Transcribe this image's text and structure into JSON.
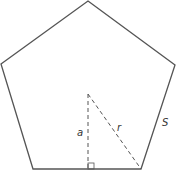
{
  "diagram": {
    "shape": "regular-pentagon",
    "vertices": [
      [
        88,
        1
      ],
      [
        175,
        65
      ],
      [
        141,
        169
      ],
      [
        33,
        169
      ],
      [
        1,
        64
      ]
    ],
    "center": [
      88,
      94
    ],
    "apothem_foot": [
      88,
      169
    ],
    "labels": {
      "apothem": "a",
      "radius": "r",
      "side": "S"
    },
    "colors": {
      "stroke": "#555555",
      "label": "#333333",
      "background": "#ffffff"
    }
  }
}
